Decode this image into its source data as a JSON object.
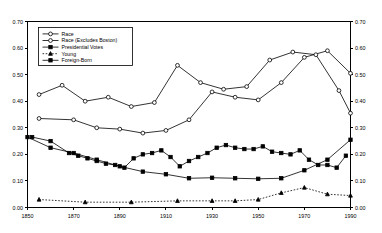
{
  "chart_data": {
    "type": "line",
    "title": "",
    "subtitle": "",
    "xlabel": "",
    "ylabel": "",
    "xlim": [
      1850,
      1990
    ],
    "ylim": [
      0.0,
      0.7
    ],
    "ytick_step": 0.1,
    "xtick_step": 20,
    "grid": false,
    "dual_y_axis": true,
    "legend_position": "top-left-inside",
    "xticks": [
      "1850",
      "1870",
      "1890",
      "1910",
      "1930",
      "1950",
      "1970",
      "1990"
    ],
    "xtick_values": [
      1850,
      1870,
      1890,
      1910,
      1930,
      1950,
      1970,
      1990
    ],
    "yticks": [
      "0.00",
      "0.10",
      "0.20",
      "0.30",
      "0.40",
      "0.50",
      "0.60",
      "0.70"
    ],
    "ytick_values": [
      0.0,
      0.1,
      0.2,
      0.3,
      0.4,
      0.5,
      0.6,
      0.7
    ],
    "yticks_right": [
      "0.00",
      "0.10",
      "0.20",
      "0.30",
      "0.40",
      "0.50",
      "0.60",
      "0.70"
    ],
    "series": [
      {
        "name": "Race",
        "marker": "open-circle",
        "linestyle": "solid",
        "x": [
          1855,
          1870,
          1880,
          1890,
          1900,
          1910,
          1920,
          1930,
          1940,
          1950,
          1960,
          1970,
          1980,
          1990
        ],
        "values": [
          0.335,
          0.33,
          0.3,
          0.295,
          0.28,
          0.29,
          0.33,
          0.435,
          0.415,
          0.405,
          0.47,
          0.565,
          0.59,
          0.505
        ]
      },
      {
        "name": "Race (Excludes Boston)",
        "marker": "open-circle",
        "linestyle": "solid",
        "x": [
          1855,
          1865,
          1875,
          1885,
          1895,
          1905,
          1915,
          1925,
          1935,
          1945,
          1955,
          1965,
          1975,
          1985,
          1990
        ],
        "values": [
          0.425,
          0.46,
          0.4,
          0.415,
          0.38,
          0.395,
          0.535,
          0.47,
          0.445,
          0.455,
          0.555,
          0.585,
          0.575,
          0.44,
          0.355
        ]
      },
      {
        "name": "Presidential Votes",
        "marker": "solid-square",
        "linestyle": "solid",
        "x": [
          1852,
          1860,
          1868,
          1872,
          1876,
          1880,
          1884,
          1888,
          1892,
          1896,
          1900,
          1904,
          1908,
          1912,
          1916,
          1920,
          1924,
          1928,
          1932,
          1936,
          1940,
          1944,
          1948,
          1952,
          1956,
          1960,
          1964,
          1968,
          1972,
          1976,
          1980,
          1984,
          1988
        ],
        "values": [
          0.265,
          0.25,
          0.205,
          0.195,
          0.185,
          0.175,
          0.165,
          0.16,
          0.15,
          0.185,
          0.2,
          0.205,
          0.215,
          0.19,
          0.155,
          0.175,
          0.19,
          0.205,
          0.225,
          0.235,
          0.225,
          0.22,
          0.22,
          0.23,
          0.21,
          0.205,
          0.2,
          0.215,
          0.18,
          0.16,
          0.16,
          0.15,
          0.195
        ]
      },
      {
        "name": "Young",
        "marker": "solid-triangle",
        "linestyle": "dotted",
        "x": [
          1855,
          1875,
          1895,
          1915,
          1930,
          1940,
          1950,
          1960,
          1970,
          1980,
          1990
        ],
        "values": [
          0.03,
          0.02,
          0.02,
          0.025,
          0.025,
          0.025,
          0.03,
          0.055,
          0.075,
          0.05,
          0.045
        ]
      },
      {
        "name": "Foreign-Born",
        "marker": "solid-square",
        "linestyle": "solid",
        "x": [
          1850,
          1860,
          1870,
          1880,
          1890,
          1900,
          1910,
          1920,
          1930,
          1940,
          1950,
          1960,
          1970,
          1980,
          1990
        ],
        "values": [
          0.265,
          0.225,
          0.205,
          0.18,
          0.155,
          0.135,
          0.125,
          0.11,
          0.112,
          0.11,
          0.108,
          0.11,
          0.14,
          0.18,
          0.255
        ]
      }
    ]
  },
  "legend": {
    "entries": [
      {
        "label": "Race"
      },
      {
        "label": "Race (Excludes Boston)"
      },
      {
        "label": "Presidential Votes"
      },
      {
        "label": "Young"
      },
      {
        "label": "Foreign-Born"
      }
    ]
  },
  "colors": {
    "line": "#000000",
    "background": "#ffffff",
    "axis": "#000000"
  }
}
